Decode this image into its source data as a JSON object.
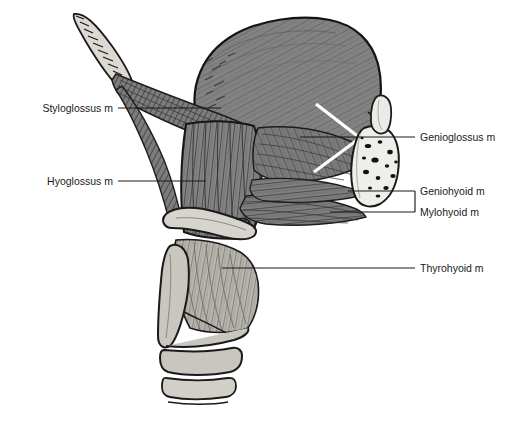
{
  "figure": {
    "background_color": "#ffffff",
    "width": 527,
    "height": 423
  },
  "palette": {
    "muscle_fill": "#808080",
    "muscle_fill_dark": "#6e6e6e",
    "muscle_fill_light": "#8d8d8d",
    "bone_fill": "#d5d2cc",
    "cartilage_fill": "#c9c6c0",
    "tooth_fill": "#e4e2dd",
    "marrow_spot": "#111111",
    "outline": "#1a1a1a",
    "label_text": "#1a1a1a",
    "leader_line": "#1a1a1a",
    "highlight_white": "#ffffff"
  },
  "labels": [
    {
      "id": "styloglossus",
      "text": "Styloglossus m",
      "side": "left",
      "text_x": 113,
      "text_y": 112,
      "leader": [
        [
          118,
          108
        ],
        [
          221,
          108
        ]
      ]
    },
    {
      "id": "hyoglossus",
      "text": "Hyoglossus m",
      "side": "left",
      "text_x": 113,
      "text_y": 185,
      "leader": [
        [
          118,
          181
        ],
        [
          206,
          181
        ]
      ]
    },
    {
      "id": "genioglossus",
      "text": "Genioglossus m",
      "side": "right",
      "text_x": 420,
      "text_y": 141,
      "leader": [
        [
          415,
          137
        ],
        [
          300,
          137
        ]
      ]
    },
    {
      "id": "geniohyoid",
      "text": "Geniohyoid m",
      "side": "right",
      "text_x": 420,
      "text_y": 195,
      "leader": [
        [
          415,
          191
        ],
        [
          348,
          191
        ]
      ]
    },
    {
      "id": "mylohyoid",
      "text": "Mylohyoid m",
      "side": "right",
      "text_x": 420,
      "text_y": 216,
      "leader": [
        [
          415,
          212
        ],
        [
          330,
          212
        ]
      ]
    },
    {
      "id": "thyrohyoid",
      "text": "Thyrohyoid m",
      "side": "right",
      "text_x": 420,
      "text_y": 272,
      "leader": [
        [
          415,
          268
        ],
        [
          222,
          268
        ]
      ]
    }
  ],
  "structures": [
    {
      "id": "styloid-process",
      "name": "Styloid process of temporal bone"
    },
    {
      "id": "tongue-body",
      "name": "Body of tongue"
    },
    {
      "id": "styloglossus-m",
      "name": "Styloglossus muscle"
    },
    {
      "id": "hyoglossus-m",
      "name": "Hyoglossus muscle"
    },
    {
      "id": "genioglossus-m",
      "name": "Genioglossus muscle"
    },
    {
      "id": "geniohyoid-m",
      "name": "Geniohyoid muscle"
    },
    {
      "id": "mylohyoid-m",
      "name": "Mylohyoid muscle"
    },
    {
      "id": "thyrohyoid-m",
      "name": "Thyrohyoid muscle"
    },
    {
      "id": "mandible",
      "name": "Mandible (cut, symphysis)"
    },
    {
      "id": "incisor-tooth",
      "name": "Lower incisor tooth"
    },
    {
      "id": "hyoid-bone",
      "name": "Hyoid bone"
    },
    {
      "id": "thyroid-cartilage",
      "name": "Thyroid cartilage"
    },
    {
      "id": "cricoid-cartilage",
      "name": "Cricoid cartilage"
    },
    {
      "id": "tracheal-ring",
      "name": "Tracheal ring"
    }
  ]
}
